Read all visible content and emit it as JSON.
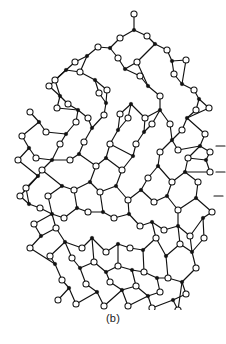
{
  "figure": {
    "caption": "(b)",
    "kind": "atomic-network-diagram",
    "background_color": "#ffffff",
    "bond_color": "#111111",
    "oxygen_fill": "#ffffff",
    "oxygen_stroke": "#111111",
    "silicon_fill": "#111111",
    "silicon_stroke": "#111111",
    "bond_width": 1.15,
    "oxygen_radius": 3.05,
    "oxygen_stroke_width": 1.05,
    "silicon_radius": 1.75,
    "legend": {
      "filled_symbol_meaning": "silicon atom",
      "open_symbol_meaning": "oxygen atom"
    },
    "chart_data": {
      "type": "scatter",
      "title": "",
      "xlabel": "",
      "ylabel": "",
      "grid": false,
      "legend_position": "none",
      "xlim": [
        0,
        226
      ],
      "ylim": [
        0,
        310
      ],
      "note": "Node coordinates are in pixel space of the original figure; y increases downward.",
      "silicon_nodes": [
        [
          134,
          30
        ],
        [
          110,
          48
        ],
        [
          155,
          44
        ],
        [
          172,
          61
        ],
        [
          87,
          56
        ],
        [
          66,
          70
        ],
        [
          95,
          80
        ],
        [
          125,
          69
        ],
        [
          148,
          86
        ],
        [
          182,
          84
        ],
        [
          199,
          99
        ],
        [
          60,
          96
        ],
        [
          78,
          110
        ],
        [
          106,
          103
        ],
        [
          131,
          104
        ],
        [
          160,
          110
        ],
        [
          187,
          118
        ],
        [
          39,
          122
        ],
        [
          66,
          134
        ],
        [
          92,
          128
        ],
        [
          118,
          130
        ],
        [
          144,
          132
        ],
        [
          172,
          140
        ],
        [
          200,
          146
        ],
        [
          29,
          148
        ],
        [
          52,
          160
        ],
        [
          79,
          154
        ],
        [
          106,
          158
        ],
        [
          133,
          156
        ],
        [
          158,
          166
        ],
        [
          185,
          172
        ],
        [
          206,
          160
        ],
        [
          38,
          176
        ],
        [
          62,
          186
        ],
        [
          90,
          182
        ],
        [
          116,
          186
        ],
        [
          141,
          190
        ],
        [
          167,
          196
        ],
        [
          196,
          198
        ],
        [
          29,
          204
        ],
        [
          52,
          214
        ],
        [
          77,
          208
        ],
        [
          103,
          212
        ],
        [
          129,
          214
        ],
        [
          152,
          222
        ],
        [
          178,
          226
        ],
        [
          203,
          218
        ],
        [
          41,
          236
        ],
        [
          65,
          242
        ],
        [
          92,
          238
        ],
        [
          118,
          244
        ],
        [
          143,
          250
        ],
        [
          166,
          256
        ],
        [
          192,
          252
        ],
        [
          55,
          264
        ],
        [
          80,
          268
        ],
        [
          106,
          272
        ],
        [
          132,
          270
        ],
        [
          157,
          278
        ],
        [
          182,
          282
        ],
        [
          69,
          288
        ],
        [
          97,
          292
        ],
        [
          122,
          290
        ],
        [
          148,
          296
        ],
        [
          173,
          300
        ]
      ],
      "oxygen_nodes": [
        [
          134,
          14
        ],
        [
          120,
          38
        ],
        [
          147,
          36
        ],
        [
          167,
          50
        ],
        [
          186,
          60
        ],
        [
          98,
          47
        ],
        [
          118,
          58
        ],
        [
          75,
          62
        ],
        [
          55,
          80
        ],
        [
          80,
          72
        ],
        [
          107,
          90
        ],
        [
          137,
          62
        ],
        [
          140,
          76
        ],
        [
          160,
          96
        ],
        [
          174,
          74
        ],
        [
          194,
          90
        ],
        [
          209,
          108
        ],
        [
          49,
          86
        ],
        [
          68,
          104
        ],
        [
          88,
          118
        ],
        [
          57,
          108
        ],
        [
          99,
          93
        ],
        [
          120,
          114
        ],
        [
          145,
          118
        ],
        [
          170,
          124
        ],
        [
          196,
          110
        ],
        [
          182,
          130
        ],
        [
          30,
          112
        ],
        [
          46,
          132
        ],
        [
          76,
          122
        ],
        [
          104,
          115
        ],
        [
          128,
          118
        ],
        [
          152,
          124
        ],
        [
          178,
          150
        ],
        [
          205,
          134
        ],
        [
          22,
          136
        ],
        [
          36,
          158
        ],
        [
          60,
          144
        ],
        [
          84,
          142
        ],
        [
          110,
          144
        ],
        [
          136,
          144
        ],
        [
          160,
          152
        ],
        [
          188,
          158
        ],
        [
          210,
          152
        ],
        [
          18,
          160
        ],
        [
          42,
          170
        ],
        [
          70,
          160
        ],
        [
          96,
          166
        ],
        [
          122,
          170
        ],
        [
          148,
          178
        ],
        [
          172,
          182
        ],
        [
          198,
          182
        ],
        [
          26,
          188
        ],
        [
          48,
          196
        ],
        [
          74,
          190
        ],
        [
          100,
          192
        ],
        [
          128,
          200
        ],
        [
          154,
          202
        ],
        [
          178,
          210
        ],
        [
          210,
          172
        ],
        [
          20,
          196
        ],
        [
          40,
          208
        ],
        [
          64,
          218
        ],
        [
          88,
          212
        ],
        [
          114,
          218
        ],
        [
          140,
          226
        ],
        [
          164,
          230
        ],
        [
          190,
          236
        ],
        [
          212,
          212
        ],
        [
          34,
          224
        ],
        [
          56,
          228
        ],
        [
          82,
          248
        ],
        [
          106,
          252
        ],
        [
          130,
          248
        ],
        [
          156,
          238
        ],
        [
          180,
          244
        ],
        [
          204,
          238
        ],
        [
          30,
          248
        ],
        [
          50,
          256
        ],
        [
          72,
          258
        ],
        [
          94,
          262
        ],
        [
          118,
          266
        ],
        [
          144,
          272
        ],
        [
          168,
          278
        ],
        [
          196,
          268
        ],
        [
          62,
          280
        ],
        [
          86,
          284
        ],
        [
          110,
          282
        ],
        [
          136,
          286
        ],
        [
          160,
          292
        ],
        [
          186,
          294
        ],
        [
          58,
          300
        ],
        [
          76,
          304
        ],
        [
          104,
          306
        ],
        [
          128,
          306
        ],
        [
          152,
          308
        ],
        [
          178,
          310
        ]
      ],
      "ring_sizes_present": [
        5,
        6,
        7,
        8
      ],
      "dangling_bond_stubs": [
        {
          "at": [
            216,
            146
          ],
          "direction": "right"
        },
        {
          "at": [
            216,
            172
          ],
          "direction": "right"
        },
        {
          "at": [
            214,
            196
          ],
          "direction": "right"
        }
      ]
    }
  }
}
